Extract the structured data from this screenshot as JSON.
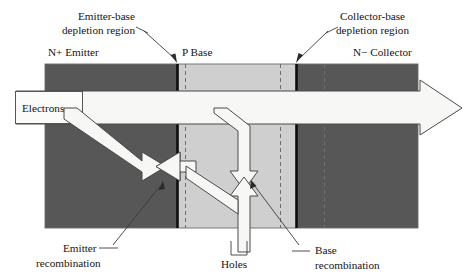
{
  "figure": {
    "background_color": "#ffffff"
  },
  "labels": {
    "emitter_base_depletion": {
      "line1": "Emitter-base",
      "line2": "depletion region"
    },
    "collector_base_depletion": {
      "line1": "Collector-base",
      "line2": "depletion region"
    },
    "n_plus_emitter": "N+ Emitter",
    "p_base": "P Base",
    "n_minus_collector": "N− Collector",
    "electrons": "Electrons",
    "holes": "Holes",
    "emitter_recombination": {
      "line1": "Emitter",
      "line2": "recombination"
    },
    "base_recombination": {
      "line1": "Base",
      "line2": "recombination"
    }
  },
  "regions": [
    {
      "name": "emitter",
      "label": "N+ Emitter",
      "fill": "#575757",
      "x": 45,
      "width": 132
    },
    {
      "name": "base",
      "label": "P Base",
      "fill": "#cfcfcf",
      "x": 177,
      "width": 119
    },
    {
      "name": "collector",
      "label": "N− Collector",
      "fill": "#575757",
      "x": 296,
      "width": 122
    }
  ],
  "colors": {
    "emitter_fill": "#575757",
    "collector_fill": "#575757",
    "base_fill": "#cfcfcf",
    "arrow_fill": "#f7f7f5",
    "arrow_stroke": "#4a4a4a",
    "junction_line": "#0d0d0d",
    "depletion_dash": "#6e6e6e",
    "text": "#141414",
    "leader_line": "#3a3a3a",
    "page_background": "#ffffff"
  },
  "geometry": {
    "device_top": 64,
    "device_bottom": 228,
    "device_left": 45,
    "device_right": 418,
    "emitter_base_junction_x": 177,
    "collector_base_junction_x": 296,
    "emitter_depletion_dash_x": 185,
    "base_depletion_dash_x": 280,
    "collector_depletion_dash_x": 324,
    "main_arrow_tip_x": 462
  },
  "flows": [
    {
      "name": "electron-injection",
      "label": "Electrons",
      "direction": "left-to-right",
      "description": "Electrons injected from emitter across base into collector"
    },
    {
      "name": "hole-injection",
      "label": "Holes",
      "direction": "bottom-up-and-left",
      "description": "Holes injected from base contact into emitter and base"
    },
    {
      "name": "emitter-recombination",
      "label": "Emitter recombination",
      "description": "Electron and hole arrows meeting head-to-head in the emitter"
    },
    {
      "name": "base-recombination",
      "label": "Base recombination",
      "description": "Electron and hole arrows meeting head-to-head in the base"
    }
  ]
}
